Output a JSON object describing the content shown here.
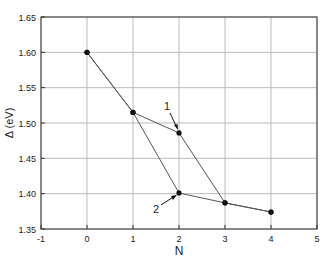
{
  "chart_data": {
    "type": "line",
    "title": "",
    "xlabel": "N",
    "ylabel": "Δ (eV)",
    "xlim": [
      -1,
      5
    ],
    "ylim": [
      1.35,
      1.65
    ],
    "xticks": [
      "-1",
      "0",
      "1",
      "2",
      "3",
      "4",
      "5"
    ],
    "yticks": [
      "1.35",
      "1.40",
      "1.45",
      "1.50",
      "1.55",
      "1.60",
      "1.65"
    ],
    "grid": true,
    "legend": "none",
    "series": [
      {
        "name": "1",
        "x": [
          0,
          1,
          2,
          3,
          4
        ],
        "y": [
          1.6,
          1.515,
          1.486,
          1.387,
          1.374
        ]
      },
      {
        "name": "2",
        "x": [
          0,
          1,
          2,
          3,
          4
        ],
        "y": [
          1.6,
          1.515,
          1.401,
          1.387,
          1.374
        ]
      }
    ],
    "annotations": [
      {
        "text": "1",
        "x": 2,
        "y": 1.486,
        "note": "arrow pointing to series 1 point at N=2"
      },
      {
        "text": "2",
        "x": 2,
        "y": 1.401,
        "note": "arrow pointing to series 2 point at N=2"
      }
    ]
  }
}
